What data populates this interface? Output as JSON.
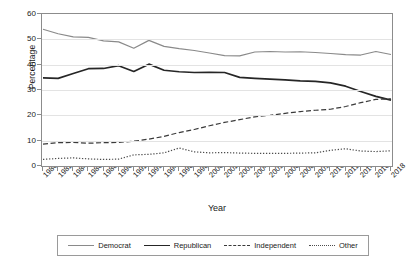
{
  "chart_data": {
    "type": "line",
    "title": "",
    "xlabel": "Year",
    "ylabel": "Percentage",
    "ylim": [
      0,
      60
    ],
    "yticks": [
      0,
      10,
      20,
      30,
      40,
      50,
      60
    ],
    "grid": true,
    "legend_position": "bottom",
    "categories": [
      "1980",
      "1982",
      "1984",
      "1986",
      "1988",
      "1990",
      "1992",
      "1993",
      "1994",
      "1996",
      "1998",
      "2000",
      "2002",
      "2003",
      "2004",
      "2005",
      "2006",
      "2008",
      "2009",
      "2010",
      "2012",
      "2014",
      "2016",
      "2018"
    ],
    "x": [
      "1980",
      "1982",
      "1984",
      "1986",
      "1988",
      "1990",
      "1992",
      "1993",
      "1994",
      "1996",
      "1998",
      "2000",
      "2002",
      "2003",
      "2004",
      "2005",
      "2006",
      "2008",
      "2009",
      "2010",
      "2012",
      "2014",
      "2016",
      "2018"
    ],
    "series": [
      {
        "name": "Democrat",
        "color": "#8a8a8a",
        "style": "solid",
        "values": [
          54.0,
          52.2,
          51.0,
          50.8,
          49.4,
          49.0,
          46.5,
          49.6,
          47.2,
          46.3,
          45.6,
          44.6,
          43.6,
          43.5,
          45.0,
          45.2,
          45.0,
          45.1,
          44.8,
          44.4,
          44.0,
          43.8,
          45.2,
          44.0
        ]
      },
      {
        "name": "Republican",
        "color": "#262626",
        "style": "solid",
        "values": [
          34.8,
          34.6,
          36.5,
          38.4,
          38.5,
          39.6,
          37.3,
          40.2,
          37.8,
          37.2,
          36.9,
          37.0,
          36.9,
          35.0,
          34.6,
          34.3,
          34.0,
          33.6,
          33.4,
          32.8,
          31.5,
          29.4,
          27.5,
          26.0
        ]
      },
      {
        "name": "Independent",
        "color": "#3a3a3a",
        "style": "dashed",
        "values": [
          8.6,
          9.2,
          9.3,
          9.0,
          9.2,
          9.3,
          9.8,
          10.6,
          11.7,
          13.2,
          14.4,
          15.9,
          17.2,
          18.3,
          19.4,
          20.0,
          20.8,
          21.5,
          22.0,
          22.4,
          23.5,
          25.0,
          26.3,
          26.5
        ]
      },
      {
        "name": "Other",
        "color": "#4d4d4d",
        "style": "dotted",
        "values": [
          2.6,
          3.0,
          3.2,
          2.8,
          2.6,
          2.7,
          4.4,
          4.6,
          5.2,
          7.1,
          5.6,
          5.2,
          5.3,
          5.1,
          5.0,
          5.0,
          5.0,
          5.1,
          5.2,
          6.2,
          6.8,
          5.9,
          5.7,
          6.0
        ]
      }
    ]
  },
  "legend": {
    "entries": [
      {
        "label": "Democrat"
      },
      {
        "label": "Republican"
      },
      {
        "label": "Independent"
      },
      {
        "label": "Other"
      }
    ]
  }
}
